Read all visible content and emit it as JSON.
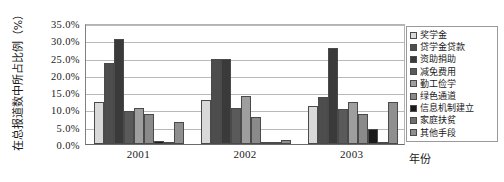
{
  "chart_data": {
    "type": "bar",
    "title": "",
    "xlabel": "年份",
    "ylabel": "在总报道数中所占比例（%）",
    "categories": [
      "2001",
      "2002",
      "2003"
    ],
    "ylim": [
      0,
      35
    ],
    "ytick_labels": [
      "0.0%",
      "5.0%",
      "10.0%",
      "15.0%",
      "20.0%",
      "25.0%",
      "30.0%",
      "35.0%"
    ],
    "ytick_values": [
      0,
      5,
      10,
      15,
      20,
      25,
      30,
      35
    ],
    "grid": true,
    "legend_position": "right",
    "series": [
      {
        "name": "奖学金",
        "color": "#d9d9d9",
        "values": [
          12.2,
          12.8,
          11.0
        ]
      },
      {
        "name": "贷学金贷款",
        "color": "#4d4d4d",
        "values": [
          23.4,
          24.5,
          13.5
        ]
      },
      {
        "name": "资助捐助",
        "color": "#3a3a3a",
        "values": [
          30.4,
          24.6,
          27.8
        ]
      },
      {
        "name": "减免费用",
        "color": "#5a5a5a",
        "values": [
          9.6,
          10.4,
          10.0
        ]
      },
      {
        "name": "勤工俭学",
        "color": "#9e9e9e",
        "values": [
          10.4,
          14.0,
          12.2
        ]
      },
      {
        "name": "绿色通道",
        "color": "#8a8a8a",
        "values": [
          8.7,
          7.8,
          8.7
        ]
      },
      {
        "name": "信息机制建立",
        "color": "#1a1a1a",
        "values": [
          0.9,
          0.2,
          4.4
        ]
      },
      {
        "name": "家庭扶贫",
        "color": "#6e6e6e",
        "values": [
          0.4,
          0.2,
          0.3
        ]
      },
      {
        "name": "其他手段",
        "color": "#8f8f8f",
        "values": [
          6.5,
          1.3,
          12.2
        ]
      }
    ]
  }
}
